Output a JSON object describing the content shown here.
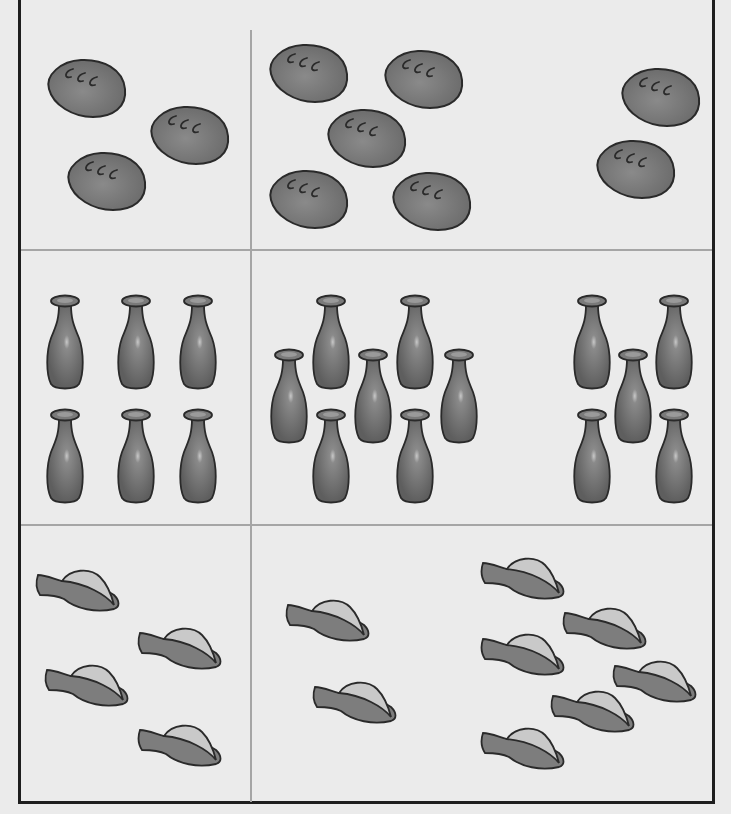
{
  "worksheet": {
    "title": "Counting worksheet",
    "rows": [
      {
        "name": "bread",
        "icon": "bread-loaf-icon",
        "groups": [
          {
            "cell": "left",
            "count": 3,
            "positions": [
              [
                43,
                57
              ],
              [
                146,
                104
              ],
              [
                63,
                150
              ]
            ]
          },
          {
            "cell": "middle-a",
            "count": 5,
            "positions": [
              [
                265,
                42
              ],
              [
                380,
                48
              ],
              [
                323,
                107
              ],
              [
                265,
                168
              ],
              [
                388,
                170
              ]
            ]
          },
          {
            "cell": "right-b",
            "count": 2,
            "positions": [
              [
                617,
                66
              ],
              [
                592,
                138
              ]
            ]
          }
        ]
      },
      {
        "name": "bottle",
        "icon": "bottle-icon",
        "groups": [
          {
            "cell": "left",
            "count": 6,
            "positions": [
              [
                45,
                294
              ],
              [
                116,
                294
              ],
              [
                178,
                294
              ],
              [
                45,
                408
              ],
              [
                116,
                408
              ],
              [
                178,
                408
              ]
            ]
          },
          {
            "cell": "middle-a",
            "count": 7,
            "positions": [
              [
                269,
                348
              ],
              [
                311,
                294
              ],
              [
                353,
                348
              ],
              [
                395,
                294
              ],
              [
                439,
                348
              ],
              [
                311,
                408
              ],
              [
                395,
                408
              ]
            ]
          },
          {
            "cell": "right-b",
            "count": 5,
            "positions": [
              [
                572,
                294
              ],
              [
                654,
                294
              ],
              [
                613,
                348
              ],
              [
                572,
                408
              ],
              [
                654,
                408
              ]
            ]
          }
        ]
      },
      {
        "name": "fish",
        "icon": "fish-icon",
        "groups": [
          {
            "cell": "left",
            "count": 4,
            "positions": [
              [
                36,
                567
              ],
              [
                138,
                625
              ],
              [
                45,
                662
              ],
              [
                138,
                722
              ]
            ]
          },
          {
            "cell": "middle-a",
            "count": 2,
            "positions": [
              [
                286,
                597
              ],
              [
                313,
                679
              ]
            ]
          },
          {
            "cell": "right-b",
            "count": 6,
            "positions": [
              [
                481,
                555
              ],
              [
                563,
                605
              ],
              [
                481,
                631
              ],
              [
                613,
                658
              ],
              [
                551,
                688
              ],
              [
                481,
                725
              ]
            ]
          }
        ]
      }
    ]
  },
  "colors": {
    "background": "#ebebeb",
    "frame": "#1e1e1e",
    "divider": "#a5a5a5",
    "bread_fill": "#7a7a7a",
    "bottle_fill": "#6e6e6e",
    "fish_body": "#7d7d7d",
    "fish_fin": "#c9c9c9",
    "outline": "#2a2a2a"
  }
}
